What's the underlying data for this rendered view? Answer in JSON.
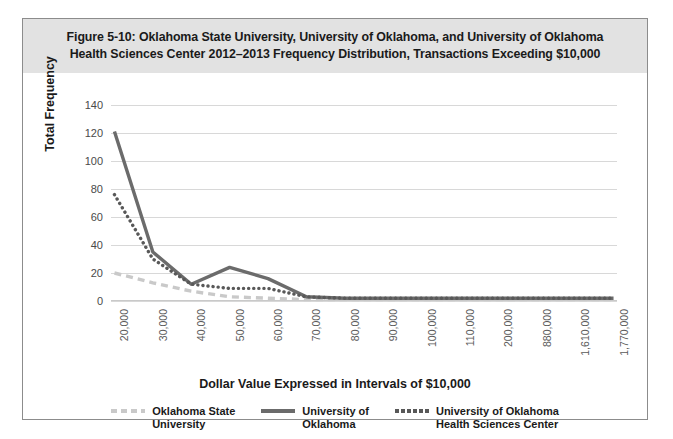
{
  "figure": {
    "title_line1": "Figure 5-10: Oklahoma State University, University of Oklahoma, and University of Oklahoma",
    "title_line2": "Health Sciences Center 2012–2013 Frequency Distribution, Transactions Exceeding $10,000"
  },
  "chart_data": {
    "type": "line",
    "title": "Figure 5-10: Oklahoma State University, University of Oklahoma, and University of Oklahoma Health Sciences Center 2012–2013 Frequency Distribution, Transactions Exceeding $10,000",
    "xlabel": "Dollar Value Expressed in Intervals of $10,000",
    "ylabel": "Total Frequency",
    "categories": [
      "20,000",
      "30,000",
      "40,000",
      "50,000",
      "60,000",
      "70,000",
      "80,000",
      "90,000",
      "100,000",
      "110,000",
      "200,000",
      "880,000",
      "1,610,000",
      "1,770,000"
    ],
    "yticks": [
      0,
      20,
      40,
      60,
      80,
      100,
      120,
      140
    ],
    "ylim": [
      0,
      140
    ],
    "grid": true,
    "legend_position": "bottom",
    "series": [
      {
        "name": "Oklahoma State University",
        "legend_label": "Oklahoma State\nUniversity",
        "style": "dashed",
        "color": "#c9c9c9",
        "values": [
          20,
          13,
          7,
          3,
          2,
          1,
          1,
          1,
          1,
          1,
          1,
          1,
          1,
          1
        ]
      },
      {
        "name": "University of Oklahoma",
        "legend_label": "University of\nOklahoma",
        "style": "solid",
        "color": "#6b6b6b",
        "values": [
          121,
          35,
          12,
          24,
          16,
          3,
          2,
          2,
          2,
          2,
          2,
          2,
          2,
          2
        ]
      },
      {
        "name": "University of Oklahoma Health Sciences Center",
        "legend_label": "University of Oklahoma\nHealth Sciences Center",
        "style": "dotted",
        "color": "#585858",
        "values": [
          76,
          30,
          12,
          9,
          9,
          3,
          2,
          2,
          2,
          2,
          2,
          2,
          2,
          2
        ]
      }
    ]
  }
}
